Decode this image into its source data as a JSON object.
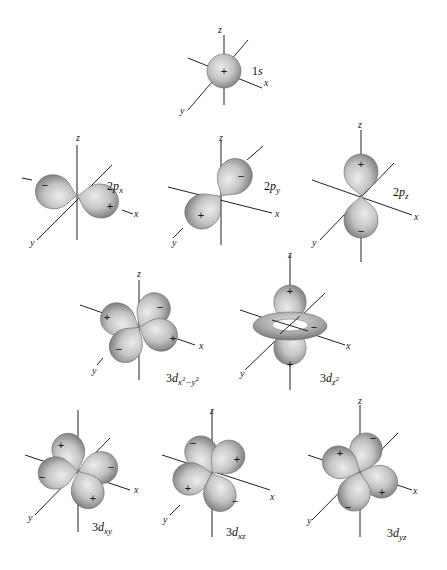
{
  "figure": {
    "colors": {
      "lobe_light": "#e2e2e2",
      "lobe_dark": "#8a8a8a",
      "axis": "#222222",
      "background": "#ffffff"
    },
    "axis_labels": {
      "x": "x",
      "y": "y",
      "z": "z"
    },
    "signs": {
      "plus": "+",
      "minus": "−"
    },
    "orbitals": [
      {
        "id": "1s",
        "label_main": "1",
        "label_it": "s",
        "label_sub": "",
        "label_sup": "",
        "lobes": [
          "+"
        ]
      },
      {
        "id": "2px",
        "label_main": "2",
        "label_it": "p",
        "label_sub": "x",
        "lobes": [
          "−",
          "+"
        ]
      },
      {
        "id": "2py",
        "label_main": "2",
        "label_it": "p",
        "label_sub": "y",
        "lobes": [
          "−",
          "+"
        ]
      },
      {
        "id": "2pz",
        "label_main": "2",
        "label_it": "p",
        "label_sub": "z",
        "lobes": [
          "+",
          "−"
        ]
      },
      {
        "id": "3dx2-y2",
        "label_main": "3",
        "label_it": "d",
        "label_sub": "x",
        "label_sup1": "2",
        "label_mid": "−y",
        "label_sup2": "2",
        "lobes": [
          "+",
          "−",
          "−",
          "+"
        ]
      },
      {
        "id": "3dz2",
        "label_main": "3",
        "label_it": "d",
        "label_sub": "z",
        "label_sup": "2",
        "lobes": [
          "+",
          "−",
          "+"
        ]
      },
      {
        "id": "3dxy",
        "label_main": "3",
        "label_it": "d",
        "label_sub": "xy",
        "lobes": [
          "+",
          "−",
          "−",
          "+"
        ]
      },
      {
        "id": "3dxz",
        "label_main": "3",
        "label_it": "d",
        "label_sub": "xz",
        "lobes": [
          "−",
          "+",
          "+",
          "−"
        ]
      },
      {
        "id": "3dyz",
        "label_main": "3",
        "label_it": "d",
        "label_sub": "yz",
        "lobes": [
          "−",
          "+",
          "+",
          "−"
        ]
      }
    ]
  }
}
